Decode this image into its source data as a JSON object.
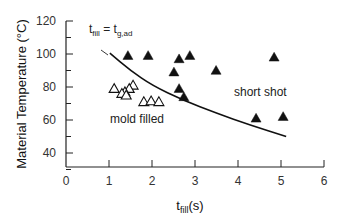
{
  "chart_data": {
    "type": "scatter",
    "title": "",
    "xlabel": "t_fill(s)",
    "xlabel_main": "t",
    "xlabel_sub": "fill",
    "xlabel_unit": "(s)",
    "ylabel": "Material Temperature (°C)",
    "xlim": [
      0,
      6
    ],
    "ylim": [
      30,
      120
    ],
    "x_ticks": [
      0,
      1,
      2,
      3,
      4,
      5,
      6
    ],
    "y_ticks": [
      40,
      60,
      80,
      100,
      120
    ],
    "grid": false,
    "legend": null,
    "series": [
      {
        "name": "short shot",
        "marker": "filled-triangle",
        "points": [
          {
            "x": 1.44,
            "y": 99
          },
          {
            "x": 1.91,
            "y": 99
          },
          {
            "x": 2.63,
            "y": 97
          },
          {
            "x": 2.88,
            "y": 99
          },
          {
            "x": 2.51,
            "y": 89
          },
          {
            "x": 3.49,
            "y": 90
          },
          {
            "x": 2.63,
            "y": 79
          },
          {
            "x": 2.74,
            "y": 74
          },
          {
            "x": 4.84,
            "y": 98
          },
          {
            "x": 4.42,
            "y": 61
          },
          {
            "x": 5.05,
            "y": 62
          }
        ]
      },
      {
        "name": "mold filled",
        "marker": "open-triangle",
        "points": [
          {
            "x": 1.12,
            "y": 79
          },
          {
            "x": 1.56,
            "y": 81
          },
          {
            "x": 1.47,
            "y": 79
          },
          {
            "x": 1.37,
            "y": 77
          },
          {
            "x": 1.3,
            "y": 76
          },
          {
            "x": 1.4,
            "y": 75
          },
          {
            "x": 1.81,
            "y": 71
          },
          {
            "x": 1.98,
            "y": 71.5
          },
          {
            "x": 2.16,
            "y": 71
          }
        ]
      },
      {
        "name": "t_fill = t_g,ad",
        "type": "line",
        "points": [
          {
            "x": 1.02,
            "y": 100.5
          },
          {
            "x": 1.5,
            "y": 90
          },
          {
            "x": 2.0,
            "y": 81
          },
          {
            "x": 2.72,
            "y": 72
          },
          {
            "x": 3.51,
            "y": 64
          },
          {
            "x": 4.28,
            "y": 57
          },
          {
            "x": 5.12,
            "y": 50
          }
        ]
      }
    ],
    "annotations": [
      {
        "text": "t_fill = t_g,ad",
        "main": "t",
        "sub1": "fill",
        "eq": " = t",
        "sub2": "g,ad",
        "x": 0.95,
        "y": 112
      },
      {
        "text": "mold filled",
        "x": 1.05,
        "y": 67
      },
      {
        "text": "short shot",
        "x": 4.1,
        "y": 81
      }
    ]
  }
}
